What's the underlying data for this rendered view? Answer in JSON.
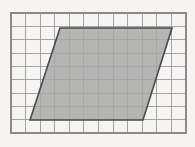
{
  "figure": {
    "background_color": "#f5f4f2",
    "canvas": {
      "width": 195,
      "height": 147
    }
  },
  "grid": {
    "name": "square-grid",
    "columns": 12,
    "rows": 9,
    "cell_size_px": 14.58,
    "origin_x_px": 11,
    "origin_y_px": 13,
    "width_px": 175,
    "height_px": 120,
    "line_color": "#9a9a9a",
    "border_color": "#8a8a8a",
    "line_width_px": 0.9,
    "border_width_px": 1.3,
    "visible": true
  },
  "shape": {
    "name": "parallelogram",
    "type": "parallelogram",
    "fill_color": "#a9a9a9",
    "fill_opacity": 0.85,
    "stroke_color": "#4a4a4a",
    "stroke_width_px": 1.6,
    "vertices_px": [
      {
        "label": "bottom-left",
        "x": 30,
        "y": 120
      },
      {
        "label": "top-left",
        "x": 60,
        "y": 28
      },
      {
        "label": "top-right",
        "x": 172,
        "y": 28
      },
      {
        "label": "bottom-right",
        "x": 143,
        "y": 120
      }
    ],
    "vertices_grid_units": [
      {
        "label": "bottom-left",
        "col": 1.3,
        "row": 7.34
      },
      {
        "label": "top-left",
        "col": 3.36,
        "row": 1.03
      },
      {
        "label": "top-right",
        "col": 11.04,
        "row": 1.03
      },
      {
        "label": "bottom-right",
        "col": 9.05,
        "row": 7.34
      }
    ],
    "base_cells": 7.7,
    "height_cells": 6.3,
    "area_cells": 48.5
  }
}
